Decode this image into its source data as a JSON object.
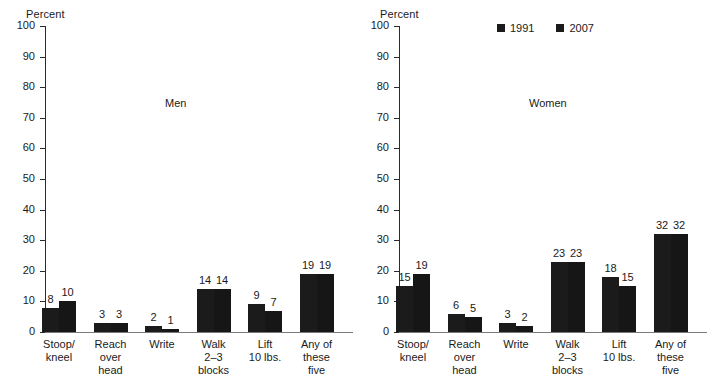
{
  "chart_data": [
    {
      "type": "bar",
      "title": "Men",
      "ylabel": "Percent",
      "xlabel": "",
      "ylim": [
        0,
        100
      ],
      "yticks": [
        0,
        10,
        20,
        30,
        40,
        50,
        60,
        70,
        80,
        90,
        100
      ],
      "grid": false,
      "legend_position": "none",
      "categories": [
        "Stoop/\nkneel",
        "Reach\nover\nhead",
        "Write",
        "Walk\n2–3\nblocks",
        "Lift\n10 lbs.",
        "Any of\nthese\nfive"
      ],
      "series": [
        {
          "name": "1991",
          "values": [
            8,
            3,
            2,
            14,
            9,
            19
          ]
        },
        {
          "name": "2007",
          "values": [
            10,
            3,
            1,
            14,
            7,
            19
          ]
        }
      ]
    },
    {
      "type": "bar",
      "title": "Women",
      "ylabel": "Percent",
      "xlabel": "",
      "ylim": [
        0,
        100
      ],
      "yticks": [
        0,
        10,
        20,
        30,
        40,
        50,
        60,
        70,
        80,
        90,
        100
      ],
      "grid": false,
      "legend_position": "top-center",
      "categories": [
        "Stoop/\nkneel",
        "Reach\nover\nhead",
        "Write",
        "Walk\n2–3\nblocks",
        "Lift\n10 lbs.",
        "Any of\nthese\nfive"
      ],
      "series": [
        {
          "name": "1991",
          "values": [
            15,
            6,
            3,
            23,
            18,
            32
          ]
        },
        {
          "name": "2007",
          "values": [
            19,
            5,
            2,
            23,
            15,
            32
          ]
        }
      ]
    }
  ],
  "colors": {
    "bar_1991": "#1b1b1b",
    "bar_2007": "#161616",
    "axis": "#2b2b2b",
    "text": "#1a1a1a",
    "background": "#ffffff"
  },
  "legend": {
    "items": [
      {
        "label": "1991"
      },
      {
        "label": "2007"
      }
    ]
  }
}
